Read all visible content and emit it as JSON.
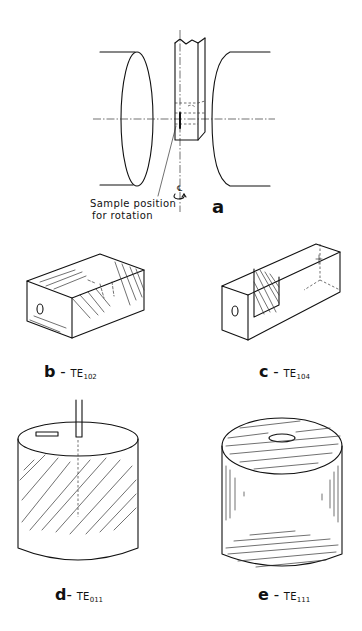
{
  "figure": {
    "panels": [
      {
        "id": "a",
        "letter": "a",
        "caption_line1": "Sample position",
        "caption_line2": "for rotation",
        "axis_symbol": "℄"
      },
      {
        "id": "b",
        "letter": "b",
        "dash": " - ",
        "mode": "TE",
        "mode_sub": "102"
      },
      {
        "id": "c",
        "letter": "c",
        "dash": " - ",
        "mode": "TE",
        "mode_sub": "104"
      },
      {
        "id": "d",
        "letter": "d",
        "dash": "- ",
        "mode": "TE",
        "mode_sub": "011"
      },
      {
        "id": "e",
        "letter": "e",
        "dash": " - ",
        "mode": "TE",
        "mode_sub": "111"
      }
    ]
  }
}
